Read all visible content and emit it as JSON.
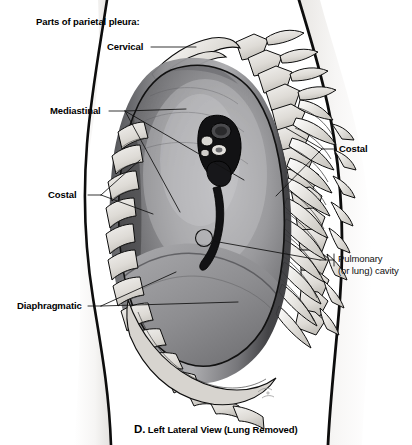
{
  "figure": {
    "title": "Parts of parietal pleura:",
    "caption_letter": "D.",
    "caption_text": "Left Lateral View (Lung Removed)"
  },
  "labels": {
    "cervical": "Cervical",
    "mediastinal": "Mediastinal",
    "costal_left": "Costal",
    "costal_right": "Costal",
    "diaphragmatic": "Diaphragmatic",
    "pulmonary_line1": "Pulmonary",
    "pulmonary_line2": "(or lung) cavity"
  },
  "colors": {
    "ink": "#000000",
    "paper": "#ffffff",
    "bone_light": "#e6e4e0",
    "bone_mid": "#c9c6c1",
    "cavity_dark": "#4a4a4c",
    "cavity_mid": "#8f8f92",
    "cavity_light": "#b9b9bc",
    "body_shade": "#f1f0ee"
  },
  "anatomy": {
    "view": "left lateral",
    "structures": [
      "cervical pleura dome",
      "clavicle",
      "first rib",
      "cervical vertebrae",
      "thoracic vertebrae",
      "rib cross-sections",
      "hilum with bronchus and pulmonary vessels",
      "pulmonary ligament",
      "diaphragmatic pleura",
      "costodiaphragmatic recess",
      "pulmonary cavity"
    ]
  }
}
